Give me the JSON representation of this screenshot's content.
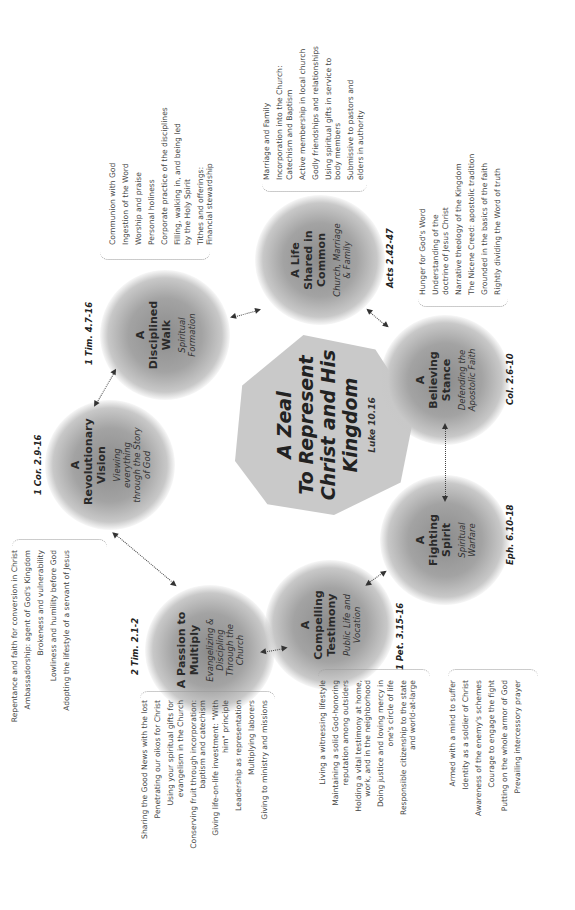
{
  "center": {
    "title_lines": [
      "A Zeal",
      "To Represent",
      "Christ and His",
      "Kingdom"
    ],
    "reference": "Luke 10.16"
  },
  "nodes": [
    {
      "id": "disciplined-walk",
      "title": "A Disciplined Walk",
      "subtitle": "Spiritual Formation",
      "reference": "1 Tim. 4.7-16",
      "items": [
        "Communion with God",
        "Ingestion of the Word",
        "Worship and praise",
        "Personal holiness",
        "Corporate practice of the disciplines",
        "Filling, walking in, and being led by the Holy Spirit",
        "Tithes and offerings: Financial stewardship"
      ]
    },
    {
      "id": "life-shared",
      "title": "A Life Shared in Common",
      "subtitle": "Church, Marriage & Family",
      "reference": "Acts 2.42-47",
      "items": [
        "Marriage and Family",
        "Incorporation into the Church: Catechism and Baptism",
        "Active membership in local church",
        "Godly friendships and relationships",
        "Using spiritual gifts in service to body members",
        "Submissive to pastors and elders in authority"
      ]
    },
    {
      "id": "believing-stance",
      "title": "A Believing Stance",
      "subtitle": "Defending the Apostolic Faith",
      "reference": "Col. 2.6-10",
      "items": [
        "Hunger for God's Word",
        "Understanding of the doctrine of Jesus Christ",
        "Narrative theology of the Kingdom",
        "The Nicene Creed: apostolic tradition",
        "Grounded in the basics of the faith",
        "Rightly dividing the Word of truth"
      ]
    },
    {
      "id": "fighting-spirit",
      "title": "A Fighting Spirit",
      "subtitle": "Spiritual Warfare",
      "reference": "Eph. 6.10-18",
      "items": [
        "Armed with a mind to suffer",
        "Identity as a soldier of Christ",
        "Awareness of the enemy's schemes",
        "Courage to engage the fight",
        "Putting on the whole armor of God",
        "Prevailing intercessory prayer"
      ]
    },
    {
      "id": "compelling-testimony",
      "title": "A Compelling Testimony",
      "subtitle": "Public Life and Vocation",
      "reference": "1 Pet. 3.15-16",
      "items": [
        "Living a witnessing lifestyle",
        "Maintaining a solid God-honoring reputation among outsiders",
        "Holding a vital testimony at home, work, and in the neighborhood",
        "Doing justice and loving mercy in one's circle of life",
        "Responsible citizenship to the state and world-at-large"
      ]
    },
    {
      "id": "passion-to-multiply",
      "title": "A Passion to Multiply",
      "subtitle": "Evangelizing & Discipling Through the Church",
      "reference": "2 Tim. 2.1-2",
      "items": [
        "Sharing the Good News with the lost",
        "Penetrating our oikos for Christ",
        "Using your spiritual gifts for evangelism in the Church",
        "Conserving fruit through incorporation: baptism and catechism",
        "Giving life-on-life investment: \"With him\" principle",
        "Leadership as representation",
        "Multiplying laborers",
        "Giving to ministry and missions"
      ]
    },
    {
      "id": "revolutionary-vision",
      "title": "A Revolutionary Vision",
      "subtitle": "Viewing everything through the Story of God",
      "reference": "1 Cor. 2.9-16",
      "items": [
        "Repentance and faith for conversion in Christ",
        "Ambassadorship: agent of God's Kingdom",
        "Brokeness and vulnerability",
        "Lowliness and humility before God",
        "Adopting the lifestyle of a servant of Jesus"
      ]
    }
  ],
  "colors": {
    "hub": "#c9c9c9",
    "node_core": "#8c8c8c",
    "text": "#333333",
    "connector": "#444444"
  }
}
